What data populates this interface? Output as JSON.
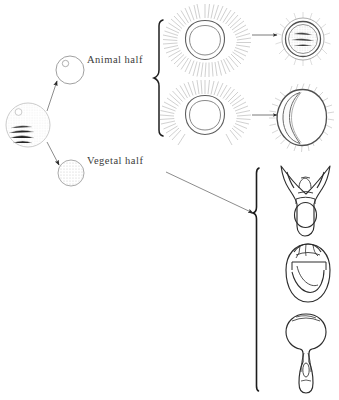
{
  "figure": {
    "type": "diagram",
    "background_color": "#ffffff",
    "ink_color": "#4a4a4a",
    "dark_ink_color": "#1a1a1a"
  },
  "labels": {
    "animal_half": "Animal half",
    "vegetal_half": "Vegetal half"
  },
  "source_cell": {
    "name": "fertilized-egg",
    "cx": 28,
    "cy": 125,
    "r": 22
  },
  "halves": [
    {
      "name": "animal-half-cell",
      "cx": 70,
      "cy": 70,
      "r": 14,
      "fill": "nucleus"
    },
    {
      "name": "vegetal-half-cell",
      "cx": 71,
      "cy": 173,
      "r": 13,
      "fill": "granules"
    }
  ],
  "blastulae": [
    {
      "name": "ciliated-blastula-full",
      "cx": 205,
      "cy": 40,
      "r": 20
    },
    {
      "name": "ciliated-blastula-partial",
      "cx": 205,
      "cy": 115,
      "r": 20
    }
  ],
  "results": [
    {
      "name": "ciliated-ball-result",
      "cx": 303,
      "cy": 40
    },
    {
      "name": "crescent-result",
      "cx": 303,
      "cy": 115
    }
  ],
  "larvae": [
    {
      "name": "pluteus-larva",
      "cx": 303,
      "cy": 198
    },
    {
      "name": "gastrula-larva",
      "cx": 308,
      "cy": 274
    },
    {
      "name": "elongated-larva",
      "cx": 306,
      "cy": 352
    }
  ],
  "braces": [
    {
      "name": "animal-half-brace",
      "x": 158,
      "y_top": 20,
      "y_bottom": 136
    },
    {
      "name": "vegetal-half-brace",
      "x": 256,
      "y_top": 168,
      "y_bottom": 392
    }
  ],
  "arrows": [
    {
      "name": "arrow-to-animal-half",
      "x1": 48,
      "y1": 110,
      "x2": 56,
      "y2": 80
    },
    {
      "name": "arrow-to-vegetal-half",
      "x1": 48,
      "y1": 142,
      "x2": 58,
      "y2": 166
    },
    {
      "name": "arrow-blastula-to-result-top",
      "x1": 250,
      "y1": 35,
      "x2": 275,
      "y2": 35
    },
    {
      "name": "arrow-blastula-to-result-bottom",
      "x1": 250,
      "y1": 115,
      "x2": 275,
      "y2": 115
    },
    {
      "name": "arrow-vegetal-to-larvae",
      "x1": 166,
      "y1": 172,
      "x2": 254,
      "y2": 213
    }
  ]
}
